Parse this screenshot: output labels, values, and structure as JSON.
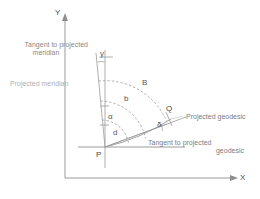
{
  "figure": {
    "type": "geodesy-projection-diagram",
    "background_color": "#ffffff",
    "line_color": "#8c8c8c",
    "text_color": "#6b6b6b"
  },
  "axes": {
    "x_label": "X",
    "y_label": "Y",
    "origin_label": "P"
  },
  "points": {
    "origin": "P",
    "far": "Q"
  },
  "angles": {
    "gamma": "γ",
    "alpha": "α",
    "delta": "δ"
  },
  "arcs": {
    "outer": "B",
    "middle": "b",
    "inner": "α",
    "chord": "d"
  },
  "callouts": {
    "tangent_meridian_line1": "Tangent to projected",
    "tangent_meridian_line2": "meridian",
    "projected_meridian": "Projected meridian",
    "projected_geodesic": "Projected geodesic",
    "tangent_geodesic_line1": "Tangent to projected",
    "tangent_geodesic_line2": "geodesic"
  }
}
